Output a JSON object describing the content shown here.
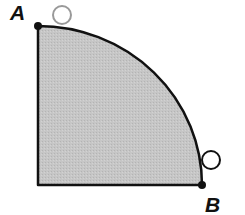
{
  "diagram": {
    "type": "quarter-circle-region",
    "labels": {
      "point_a": "A",
      "point_b": "B"
    },
    "colors": {
      "fill": "#c4c4c4",
      "stroke": "#111111",
      "circle_stroke": "#999999",
      "circle_stroke_b": "#111111"
    }
  }
}
